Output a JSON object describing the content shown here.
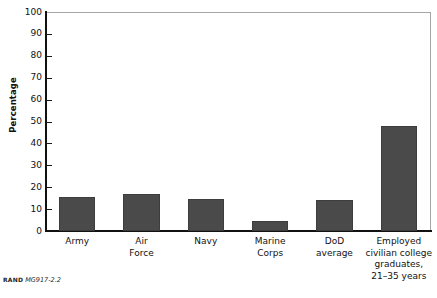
{
  "figure": {
    "source_mark": "RAND",
    "figure_id": "MG917-2.2"
  },
  "colors": {
    "bar_fill": "#4a4a4a",
    "bar_edge": "#3d3d3d",
    "axis": "#111111",
    "frame": "#a6a6a6",
    "background": "#ffffff",
    "text": "#111111"
  },
  "chart_data": {
    "type": "bar",
    "title": "",
    "xlabel": "",
    "ylabel": "Percentage",
    "ylim": [
      0,
      100
    ],
    "yticks": [
      0,
      10,
      20,
      30,
      40,
      50,
      60,
      70,
      80,
      90,
      100
    ],
    "ytick_labels": [
      "0",
      "10",
      "20",
      "30",
      "40",
      "50",
      "60",
      "70",
      "80",
      "90",
      "100"
    ],
    "grid": false,
    "legend": null,
    "categories": [
      "Army",
      "Air Force",
      "Navy",
      "Marine Corps",
      "DoD average",
      "Employed civilian college graduates, 21–35 years"
    ],
    "category_lines": [
      [
        "Army"
      ],
      [
        "Air",
        "Force"
      ],
      [
        "Navy"
      ],
      [
        "Marine",
        "Corps"
      ],
      [
        "DoD",
        "average"
      ],
      [
        "Employed",
        "civilian college",
        "graduates,",
        "21–35 years"
      ]
    ],
    "values": [
      15.5,
      17,
      14.5,
      4.5,
      14,
      48
    ]
  }
}
